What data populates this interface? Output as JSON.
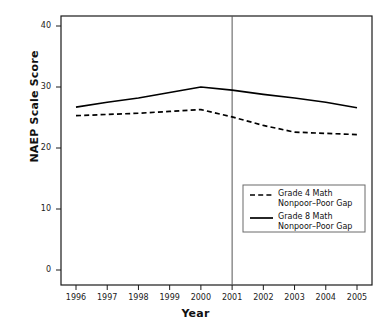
{
  "chart_data": {
    "type": "line",
    "title": "",
    "xlabel": "Year",
    "ylabel": "NAEP Scale Score",
    "x": [
      1996,
      1997,
      1998,
      1999,
      2000,
      2001,
      2002,
      2003,
      2004,
      2005
    ],
    "xtick_labels": [
      "1996",
      "1997",
      "1998",
      "1999",
      "2000",
      "2001",
      "2002",
      "2003",
      "2004",
      "2005"
    ],
    "ytick_labels": [
      "0",
      "10",
      "20",
      "30",
      "40"
    ],
    "ytick_values": [
      0,
      10,
      20,
      30,
      40
    ],
    "xlim": [
      1996,
      2005
    ],
    "ylim": [
      0,
      42
    ],
    "grid": false,
    "legend_position": "center-right",
    "series": [
      {
        "name": "Grade 4 Math Nonpoor–Poor Gap",
        "style": "dashed",
        "color": "#000000",
        "values": [
          25.3,
          25.5,
          25.7,
          26.0,
          26.3,
          25.1,
          23.7,
          22.6,
          22.4,
          22.2
        ]
      },
      {
        "name": "Grade 8 Math Nonpoor–Poor Gap",
        "style": "solid",
        "color": "#000000",
        "values": [
          26.7,
          27.5,
          28.2,
          29.1,
          30.0,
          29.5,
          28.8,
          28.2,
          27.5,
          26.6
        ]
      }
    ],
    "reference_line": {
      "x": 2001,
      "orientation": "vertical",
      "color": "#555555"
    }
  },
  "legend": {
    "entries": [
      {
        "line1": "Grade 4 Math",
        "line2": "Nonpoor–Poor Gap",
        "style": "dashed"
      },
      {
        "line1": "Grade 8 Math",
        "line2": "Nonpoor–Poor Gap",
        "style": "solid"
      }
    ]
  }
}
